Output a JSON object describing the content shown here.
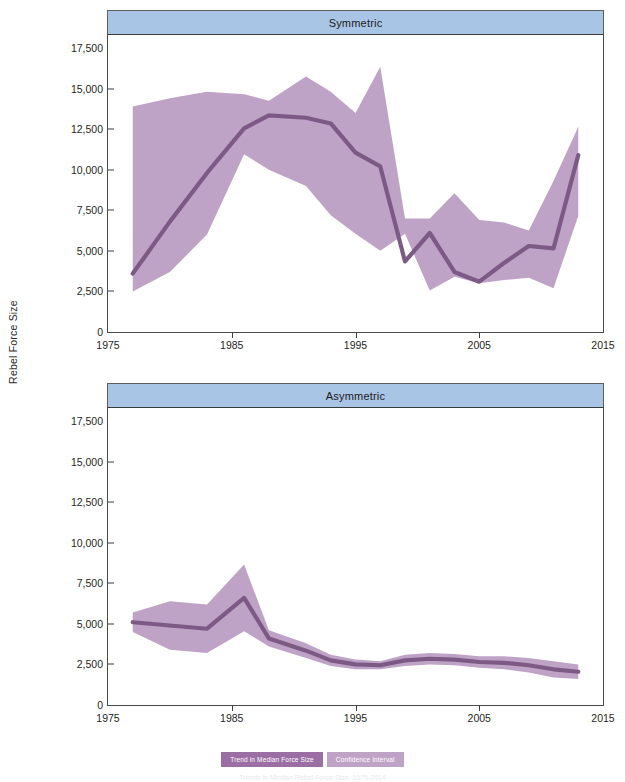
{
  "figure": {
    "ylabel": "Rebel Force Size",
    "caption": "Trends in Median Rebel Force Size, 1975-2014"
  },
  "legend": {
    "position": "bottom-center",
    "items": [
      {
        "label": "Trend in Median Force Size",
        "color": "#9b6fa4",
        "key": "trend"
      },
      {
        "label": "Confidence Interval",
        "color": "#bfa3c7",
        "key": "ci"
      }
    ]
  },
  "colors": {
    "strip_blue": "#a9c5e6",
    "band_purple": "#bfa3c7",
    "line_purple": "#7d5a86",
    "axis": "#3d3d3d"
  },
  "axes": {
    "xlim": [
      1975,
      2015
    ],
    "ylim": [
      0,
      18300
    ],
    "xticks": [
      1975,
      1985,
      1995,
      2005,
      2015
    ],
    "xtick_labels": [
      "1975",
      "1985",
      "1995",
      "2005",
      "2015"
    ],
    "yticks": [
      0,
      2500,
      5000,
      7500,
      10000,
      12500,
      15000,
      17500
    ],
    "ytick_labels": [
      "0",
      "2,500",
      "5,000",
      "7,500",
      "10,000",
      "12,500",
      "15,000",
      "17,500"
    ],
    "grid": false
  },
  "chart_data": [
    {
      "type": "line",
      "title": "Symmetric",
      "panel": "top",
      "xlabel": "",
      "ylabel": "Rebel Force Size",
      "xlim": [
        1975,
        2015
      ],
      "ylim": [
        0,
        18300
      ],
      "grid": false,
      "x": [
        1977,
        1980,
        1983,
        1986,
        1988,
        1991,
        1993,
        1995,
        1997,
        1999,
        2001,
        2003,
        2005,
        2007,
        2009,
        2011,
        2013
      ],
      "series": [
        {
          "name": "Trend in Median Force Size",
          "values": [
            3600,
            6800,
            9800,
            12550,
            13350,
            13200,
            12850,
            11050,
            10200,
            4350,
            6100,
            3700,
            3100,
            4250,
            5300,
            5150,
            10900
          ]
        }
      ],
      "confidence_interval": {
        "name": "Confidence Interval",
        "lower": [
          2500,
          3700,
          6000,
          10950,
          10000,
          9000,
          7200,
          6050,
          5000,
          6050,
          2550,
          3400,
          3000,
          3200,
          3350,
          2700,
          7150
        ],
        "upper": [
          13900,
          14400,
          14800,
          14650,
          14250,
          15750,
          14800,
          13500,
          16350,
          7000,
          7000,
          8550,
          6900,
          6750,
          6250,
          9300,
          12650
        ]
      }
    },
    {
      "type": "line",
      "title": "Asymmetric",
      "panel": "bottom",
      "xlabel": "",
      "ylabel": "Rebel Force Size",
      "xlim": [
        1975,
        2015
      ],
      "ylim": [
        0,
        18300
      ],
      "grid": false,
      "x": [
        1977,
        1980,
        1983,
        1986,
        1988,
        1991,
        1993,
        1995,
        1997,
        1999,
        2001,
        2003,
        2005,
        2007,
        2009,
        2011,
        2013
      ],
      "series": [
        {
          "name": "Trend in Median Force Size",
          "values": [
            5100,
            4900,
            4700,
            6600,
            4100,
            3350,
            2750,
            2500,
            2450,
            2750,
            2850,
            2800,
            2650,
            2600,
            2450,
            2200,
            2050
          ]
        }
      ],
      "confidence_interval": {
        "name": "Confidence Interval",
        "lower": [
          4500,
          3400,
          3200,
          4550,
          3600,
          2900,
          2400,
          2200,
          2200,
          2400,
          2500,
          2450,
          2300,
          2200,
          2000,
          1700,
          1600
        ]
      }
    }
  ]
}
